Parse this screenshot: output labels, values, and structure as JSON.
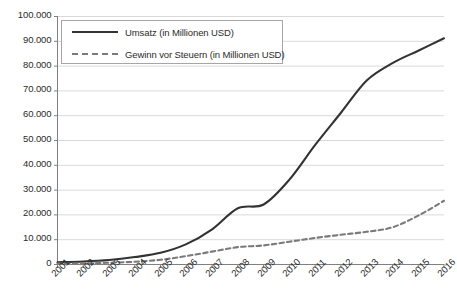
{
  "chart_data": {
    "type": "line",
    "title": "",
    "subtitle": "",
    "xlabel": "",
    "ylabel": "",
    "grid": true,
    "legend_position": "upper-left-inside",
    "categories": [
      "2001",
      "2002",
      "2003",
      "2004",
      "2005",
      "2006",
      "2007",
      "2008",
      "2009",
      "2010",
      "2011",
      "2012",
      "2013",
      "2014",
      "2015",
      "2016"
    ],
    "x": [
      2001,
      2002,
      2003,
      2004,
      2005,
      2006,
      2007,
      2008,
      2009,
      2010,
      2011,
      2012,
      2013,
      2014,
      2015,
      2016
    ],
    "ylim": [
      0,
      100000
    ],
    "ytick_values": [
      0,
      10000,
      20000,
      30000,
      40000,
      50000,
      60000,
      70000,
      80000,
      90000,
      100000
    ],
    "ytick_labels": [
      "0",
      "10.000",
      "20.000",
      "30.000",
      "40.000",
      "50.000",
      "60.000",
      "70.000",
      "80.000",
      "90.000",
      "100.000"
    ],
    "series": [
      {
        "name": "Umsatz (in Millionen USD)",
        "style": "solid",
        "color": "#333333",
        "values": [
          700,
          1000,
          1600,
          2800,
          4500,
          8000,
          14000,
          22500,
          24000,
          34000,
          48000,
          61000,
          74000,
          81000,
          86000,
          91000
        ]
      },
      {
        "name": "Gewinn vor Steuern (in Millionen USD)",
        "style": "dashed",
        "color": "#7a7a7a",
        "values": [
          150,
          250,
          500,
          900,
          1700,
          3200,
          5000,
          6800,
          7500,
          9000,
          10500,
          11800,
          13000,
          14800,
          19500,
          25500
        ]
      }
    ],
    "legend": [
      {
        "label": "Umsatz (in Millionen USD)",
        "style": "solid"
      },
      {
        "label": "Gewinn vor Steuern (in Millionen USD)",
        "style": "dashed"
      }
    ],
    "colors": {
      "umsatz": "#333333",
      "gewinn": "#7a7a7a",
      "grid": "#d9d9d9",
      "axis": "#808080",
      "text": "#2b2b2b"
    }
  }
}
